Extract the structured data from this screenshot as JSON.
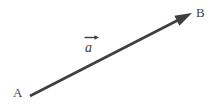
{
  "figure": {
    "background_color": "#ffffff",
    "width": 218,
    "height": 110,
    "stroke_color": "#3f3f3f",
    "labels": {
      "start_point": "A",
      "end_point": "B",
      "vector_name": "a",
      "vector_accent": "right-arrow-accent"
    },
    "geometry": {
      "tail_x": 30,
      "tail_y": 96,
      "head_x": 192,
      "head_y": 13,
      "line_width": 2.6,
      "arrowhead_length": 17,
      "arrowhead_half_width": 5.5
    }
  }
}
